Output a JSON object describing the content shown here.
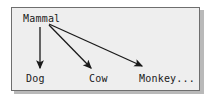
{
  "diagram": {
    "frame": {
      "border_color": "#6e6e6e",
      "background_color": "#eeeeee",
      "shadow_color": "#b9b9b9"
    },
    "arrow_color": "#1a1a1a",
    "text_color": "#1a1a1a",
    "nodes": [
      {
        "id": "mammal",
        "label": "Mammal",
        "role": "parent"
      },
      {
        "id": "dog",
        "label": "Dog",
        "role": "child"
      },
      {
        "id": "cow",
        "label": "Cow",
        "role": "child"
      },
      {
        "id": "monkey",
        "label": "Monkey...",
        "role": "child"
      }
    ],
    "edges": [
      {
        "id": "mammal-to-dog",
        "from": "Mammal",
        "to": "Dog",
        "style": "solid-arrow"
      },
      {
        "id": "mammal-to-cow",
        "from": "Mammal",
        "to": "Cow",
        "style": "solid-arrow"
      },
      {
        "id": "mammal-to-monkey",
        "from": "Mammal",
        "to": "Monkey...",
        "style": "solid-arrow"
      }
    ]
  }
}
